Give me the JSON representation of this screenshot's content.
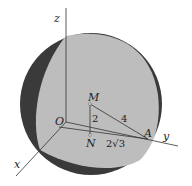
{
  "diagram": {
    "type": "sphere with coordinate axes",
    "axes": {
      "x": "x",
      "y": "y",
      "z": "z"
    },
    "points": {
      "O": "O",
      "M": "M",
      "N": "N",
      "A": "A"
    },
    "segments": {
      "MN": "2",
      "MA": "4",
      "NA": "2√3"
    },
    "colors": {
      "sphere_face": "#bdbdbd",
      "sphere_shadow": "#3a3a3a",
      "lines": "#333333"
    }
  }
}
